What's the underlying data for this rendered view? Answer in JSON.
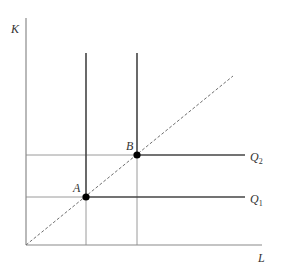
{
  "diagram": {
    "type": "leontief-isoquant",
    "axes": {
      "y_label": "K",
      "x_label": "L"
    },
    "points": [
      {
        "label": "A",
        "x": 86,
        "y": 197
      },
      {
        "label": "B",
        "x": 137,
        "y": 155
      }
    ],
    "isoquants": [
      {
        "label": "Q",
        "subscript": "1"
      },
      {
        "label": "Q",
        "subscript": "2"
      }
    ],
    "expansion_path": "dashed ray from origin through A and B",
    "colors": {
      "axis": "#888888",
      "isoquant": "#444444",
      "grid": "#999999",
      "dashed": "#777777",
      "point": "#000000"
    }
  }
}
